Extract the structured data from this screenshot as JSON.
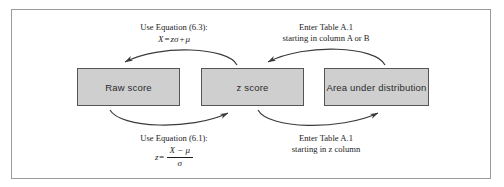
{
  "diagram": {
    "type": "flow-diagram",
    "title_visible": false,
    "colors": {
      "box_fill": "#cfcfcf",
      "box_border": "#555555",
      "frame_border": "#9a9a9a",
      "arrow": "#3a3a3a",
      "text": "#1d1d1d",
      "background": "#ffffff"
    },
    "nodes": [
      {
        "id": "raw-score",
        "label": "Raw score"
      },
      {
        "id": "z-score",
        "label": "z score"
      },
      {
        "id": "area-under-distribution",
        "label": "Area under distribution"
      }
    ],
    "labels": {
      "top_left": {
        "line1": "Use Equation (6.3):",
        "equation": {
          "lhs": "X",
          "operator": "=",
          "rhs_term1": "zσ",
          "rhs_operator": "+",
          "rhs_term2": "μ",
          "plain": "X = zσ + μ"
        }
      },
      "top_right": {
        "line1": "Enter Table A.1",
        "line2": "starting in column A or B"
      },
      "bottom_left": {
        "line1": "Use Equation (6.1):",
        "equation": {
          "lhs": "z",
          "operator": "=",
          "numerator": "X − μ",
          "denominator": "σ",
          "plain": "z = (X − μ) / σ"
        }
      },
      "bottom_right": {
        "line1": "Enter Table A.1",
        "line2": "starting in z column"
      }
    },
    "arrows": [
      {
        "id": "arrow-z-to-raw",
        "from": "z-score",
        "to": "raw-score",
        "direction": "right-to-left",
        "position": "top",
        "icon": "curved-arrow-left-icon"
      },
      {
        "id": "arrow-area-to-z",
        "from": "area-under-distribution",
        "to": "z-score",
        "direction": "right-to-left",
        "position": "top",
        "icon": "curved-arrow-left-icon"
      },
      {
        "id": "arrow-raw-to-z",
        "from": "raw-score",
        "to": "z-score",
        "direction": "left-to-right",
        "position": "bottom",
        "icon": "curved-arrow-right-icon"
      },
      {
        "id": "arrow-z-to-area",
        "from": "z-score",
        "to": "area-under-distribution",
        "direction": "left-to-right",
        "position": "bottom",
        "icon": "curved-arrow-right-icon"
      }
    ]
  }
}
